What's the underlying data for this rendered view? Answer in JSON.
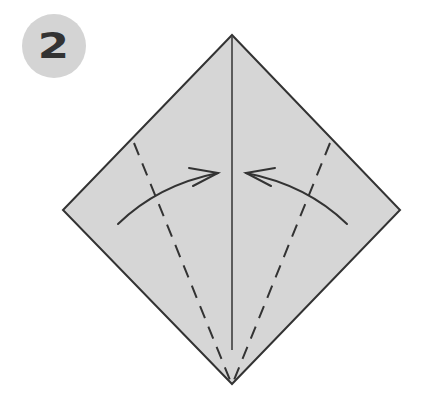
{
  "step": {
    "number": "2",
    "badge_color": "#d4d4d4",
    "text_color": "#333333"
  },
  "diagram": {
    "paper_color": "#d6d6d6",
    "line_color": "#333333",
    "elements": [
      {
        "type": "paper-square",
        "points": [
          [
            232,
            35
          ],
          [
            400,
            210
          ],
          [
            232,
            384
          ],
          [
            63,
            210
          ]
        ]
      },
      {
        "type": "center-crease",
        "from": [
          232,
          37
        ],
        "to": [
          232,
          350
        ]
      },
      {
        "type": "valley-fold-left",
        "from": [
          134,
          143
        ],
        "to": [
          230,
          380
        ],
        "style": "dashed"
      },
      {
        "type": "valley-fold-right",
        "from": [
          330,
          143
        ],
        "to": [
          234,
          380
        ],
        "style": "dashed"
      },
      {
        "type": "fold-arrow-left",
        "from": [
          118,
          224
        ],
        "to": [
          218,
          173
        ]
      },
      {
        "type": "fold-arrow-right",
        "from": [
          347,
          224
        ],
        "to": [
          246,
          173
        ]
      }
    ]
  }
}
